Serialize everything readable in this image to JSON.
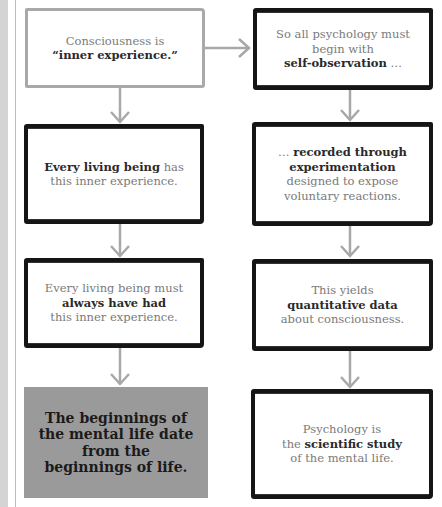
{
  "diagram": {
    "left_column": [
      {
        "id": "box1",
        "pre": "Consciousness is",
        "bold": "“inner experience",
        "post": ".”",
        "style": "gray-border"
      },
      {
        "id": "box2",
        "bold": "Every living being",
        "post": " has this inner experience.",
        "style": "black-border"
      },
      {
        "id": "box3",
        "pre": "Every living being must",
        "bold": "always have had",
        "post": "this inner experience.",
        "style": "black-border"
      },
      {
        "id": "box4",
        "text": "The beginnings of the mental life date from the beginnings of life.",
        "style": "filled"
      }
    ],
    "right_column": [
      {
        "id": "box5",
        "pre": "So all psychology must begin with",
        "bold": "self-observation",
        "post": " …",
        "style": "black-border"
      },
      {
        "id": "box6",
        "pre": "… ",
        "bold": "recorded through experimentation",
        "post": "designed to expose voluntary reactions.",
        "style": "black-border"
      },
      {
        "id": "box7",
        "pre": "This yields",
        "bold": "quantitative data",
        "post": "about consciousness.",
        "style": "black-border"
      },
      {
        "id": "box8",
        "pre": "Psychology is",
        "pre2": "the ",
        "bold": "scientific study",
        "post": "of the mental life.",
        "style": "black-border"
      }
    ],
    "colors": {
      "arrow": "#a8a8a8",
      "border_dark": "#151515",
      "border_light": "#a9a9a9",
      "fill": "#9a9a9a"
    }
  }
}
